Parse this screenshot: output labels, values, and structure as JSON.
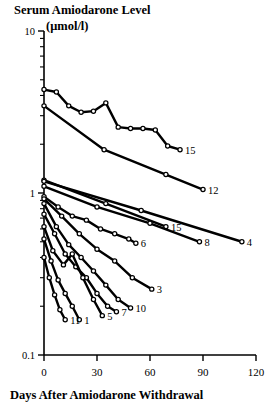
{
  "figure": {
    "title_main": "Serum Amiodarone Level",
    "title_units": "(μmol/l)",
    "xlabel": "Days After Amiodarone Withdrawal"
  },
  "axes": {
    "x_ticks": [
      "0",
      "30",
      "60",
      "90",
      "120"
    ],
    "y_ticks": [
      "10",
      "1",
      "0.1"
    ]
  },
  "chart_data": {
    "type": "line",
    "title": "Serum Amiodarone Level (μmol/l)",
    "xlabel": "Days After Amiodarone Withdrawal",
    "ylabel": "Serum Amiodarone Level (μmol/l)",
    "yscale": "log",
    "xlim": [
      0,
      120
    ],
    "ylim": [
      0.1,
      10
    ],
    "xticks": [
      0,
      30,
      60,
      90,
      120
    ],
    "yticks": [
      0.1,
      1,
      10
    ],
    "grid": false,
    "legend": "series end labels (patient number at right end of each line)",
    "marker": "open circle",
    "series": [
      {
        "name": "15",
        "label": "15",
        "x": [
          0,
          7,
          14,
          21,
          28,
          35,
          42,
          49,
          56,
          63,
          70,
          77
        ],
        "y": [
          4.35,
          4.2,
          3.45,
          3.15,
          3.2,
          3.6,
          2.55,
          2.5,
          2.5,
          2.45,
          1.95,
          1.85
        ]
      },
      {
        "name": "12",
        "label": "12",
        "x": [
          0,
          34,
          69,
          90
        ],
        "y": [
          3.45,
          1.85,
          1.3,
          1.05
        ]
      },
      {
        "name": "15b",
        "label": "15",
        "x": [
          0,
          35,
          69
        ],
        "y": [
          1.2,
          0.86,
          0.62
        ]
      },
      {
        "name": "4",
        "label": "4",
        "x": [
          0,
          55,
          112
        ],
        "y": [
          1.18,
          0.78,
          0.5
        ]
      },
      {
        "name": "8",
        "label": "8",
        "x": [
          0,
          30,
          60,
          88
        ],
        "y": [
          1.1,
          0.82,
          0.65,
          0.5
        ]
      },
      {
        "name": "6",
        "label": "6",
        "x": [
          0,
          8,
          16,
          24,
          32,
          40,
          48,
          52
        ],
        "y": [
          0.95,
          0.82,
          0.72,
          0.68,
          0.6,
          0.56,
          0.52,
          0.49
        ]
      },
      {
        "name": "3",
        "label": "3",
        "x": [
          0,
          10,
          20,
          30,
          40,
          50,
          61
        ],
        "y": [
          0.92,
          0.72,
          0.56,
          0.45,
          0.38,
          0.3,
          0.255
        ]
      },
      {
        "name": "10",
        "label": "10",
        "x": [
          0,
          7,
          14,
          21,
          28,
          35,
          42,
          49
        ],
        "y": [
          0.86,
          0.62,
          0.48,
          0.4,
          0.33,
          0.27,
          0.22,
          0.195
        ]
      },
      {
        "name": "7",
        "label": "7",
        "x": [
          0,
          6,
          12,
          18,
          24,
          30,
          36,
          41
        ],
        "y": [
          0.74,
          0.56,
          0.42,
          0.35,
          0.3,
          0.24,
          0.2,
          0.185
        ]
      },
      {
        "name": "5",
        "label": "5",
        "x": [
          0,
          5,
          11,
          16,
          22,
          28,
          33
        ],
        "y": [
          0.62,
          0.44,
          0.36,
          0.42,
          0.3,
          0.22,
          0.175
        ]
      },
      {
        "name": "1",
        "label": "1",
        "x": [
          0,
          4,
          8,
          12,
          16,
          20
        ],
        "y": [
          0.52,
          0.38,
          0.29,
          0.24,
          0.2,
          0.165
        ]
      },
      {
        "name": "11",
        "label": "11",
        "x": [
          0,
          3,
          6,
          9,
          12
        ],
        "y": [
          0.4,
          0.3,
          0.235,
          0.19,
          0.165
        ]
      }
    ]
  }
}
